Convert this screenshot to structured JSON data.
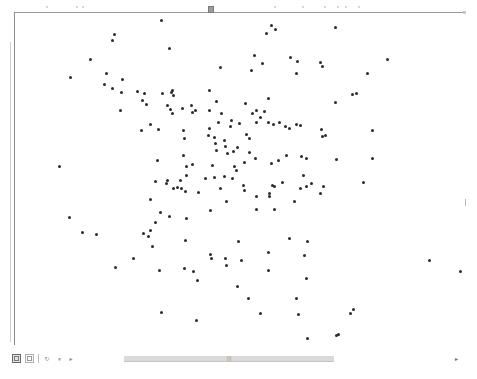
{
  "viewer": {
    "handle_icon": "resize-handle-icon",
    "toolbar": [
      {
        "name": "view-toggle-button",
        "icon": "grid-view-icon",
        "active": true
      },
      {
        "name": "page-button",
        "icon": "page-icon",
        "active": false
      },
      {
        "name": "refresh-button",
        "icon": "refresh-icon",
        "glyph": "↻"
      },
      {
        "name": "pause-button",
        "icon": "pause-icon",
        "glyph": "⏸"
      },
      {
        "name": "play-button",
        "icon": "play-icon",
        "glyph": "▸"
      }
    ],
    "scrollbar": {
      "thumb_grip": "|||",
      "right_arrow": "▸"
    }
  },
  "points": [
    [
      161,
      20
    ],
    [
      271,
      25
    ],
    [
      275,
      29
    ],
    [
      266,
      33
    ],
    [
      335,
      27
    ],
    [
      114,
      34
    ],
    [
      112,
      40
    ],
    [
      169,
      48
    ],
    [
      254,
      55
    ],
    [
      290,
      57
    ],
    [
      262,
      63
    ],
    [
      90,
      59
    ],
    [
      70,
      77
    ],
    [
      106,
      73
    ],
    [
      122,
      79
    ],
    [
      104,
      84
    ],
    [
      112,
      88
    ],
    [
      121,
      92
    ],
    [
      162,
      93
    ],
    [
      172,
      90
    ],
    [
      209,
      90
    ],
    [
      251,
      70
    ],
    [
      220,
      67
    ],
    [
      297,
      61
    ],
    [
      320,
      62
    ],
    [
      322,
      66
    ],
    [
      296,
      73
    ],
    [
      268,
      98
    ],
    [
      367,
      73
    ],
    [
      387,
      59
    ],
    [
      356,
      93
    ],
    [
      352,
      94
    ],
    [
      335,
      102
    ],
    [
      137,
      91
    ],
    [
      144,
      93
    ],
    [
      142,
      100
    ],
    [
      146,
      104
    ],
    [
      120,
      110
    ],
    [
      171,
      92
    ],
    [
      173,
      95
    ],
    [
      167,
      105
    ],
    [
      182,
      108
    ],
    [
      191,
      105
    ],
    [
      195,
      110
    ],
    [
      192,
      112
    ],
    [
      170,
      109
    ],
    [
      172,
      113
    ],
    [
      209,
      110
    ],
    [
      216,
      101
    ],
    [
      221,
      113
    ],
    [
      245,
      103
    ],
    [
      252,
      113
    ],
    [
      260,
      117
    ],
    [
      264,
      111
    ],
    [
      256,
      110
    ],
    [
      256,
      122
    ],
    [
      150,
      124
    ],
    [
      158,
      129
    ],
    [
      141,
      130
    ],
    [
      183,
      130
    ],
    [
      209,
      128
    ],
    [
      218,
      122
    ],
    [
      239,
      123
    ],
    [
      230,
      126
    ],
    [
      268,
      122
    ],
    [
      273,
      124
    ],
    [
      279,
      122
    ],
    [
      296,
      124
    ],
    [
      289,
      128
    ],
    [
      285,
      126
    ],
    [
      300,
      125
    ],
    [
      321,
      129
    ],
    [
      322,
      136
    ],
    [
      325,
      135
    ],
    [
      372,
      130
    ],
    [
      184,
      138
    ],
    [
      208,
      135
    ],
    [
      214,
      137
    ],
    [
      215,
      143
    ],
    [
      225,
      146
    ],
    [
      216,
      150
    ],
    [
      227,
      153
    ],
    [
      233,
      151
    ],
    [
      237,
      147
    ],
    [
      246,
      134
    ],
    [
      231,
      120
    ],
    [
      224,
      140
    ],
    [
      249,
      138
    ],
    [
      249,
      152
    ],
    [
      183,
      155
    ],
    [
      157,
      160
    ],
    [
      186,
      166
    ],
    [
      192,
      164
    ],
    [
      186,
      175
    ],
    [
      212,
      165
    ],
    [
      234,
      166
    ],
    [
      244,
      162
    ],
    [
      255,
      158
    ],
    [
      271,
      163
    ],
    [
      278,
      160
    ],
    [
      286,
      155
    ],
    [
      301,
      156
    ],
    [
      306,
      158
    ],
    [
      336,
      159
    ],
    [
      372,
      158
    ],
    [
      59,
      166
    ],
    [
      155,
      181
    ],
    [
      167,
      180
    ],
    [
      166,
      183
    ],
    [
      173,
      188
    ],
    [
      177,
      187
    ],
    [
      181,
      188
    ],
    [
      180,
      180
    ],
    [
      185,
      191
    ],
    [
      198,
      192
    ],
    [
      205,
      178
    ],
    [
      214,
      177
    ],
    [
      224,
      176
    ],
    [
      220,
      188
    ],
    [
      232,
      178
    ],
    [
      236,
      170
    ],
    [
      243,
      185
    ],
    [
      244,
      190
    ],
    [
      272,
      185
    ],
    [
      274,
      186
    ],
    [
      269,
      193
    ],
    [
      282,
      182
    ],
    [
      303,
      175
    ],
    [
      300,
      188
    ],
    [
      306,
      186
    ],
    [
      311,
      183
    ],
    [
      323,
      186
    ],
    [
      320,
      193
    ],
    [
      363,
      182
    ],
    [
      150,
      199
    ],
    [
      160,
      212
    ],
    [
      169,
      216
    ],
    [
      155,
      222
    ],
    [
      143,
      233
    ],
    [
      150,
      230
    ],
    [
      186,
      218
    ],
    [
      210,
      210
    ],
    [
      226,
      201
    ],
    [
      256,
      196
    ],
    [
      269,
      196
    ],
    [
      256,
      209
    ],
    [
      274,
      209
    ],
    [
      294,
      201
    ],
    [
      69,
      217
    ],
    [
      82,
      232
    ],
    [
      96,
      234
    ],
    [
      115,
      267
    ],
    [
      133,
      258
    ],
    [
      148,
      236
    ],
    [
      152,
      246
    ],
    [
      185,
      240
    ],
    [
      159,
      270
    ],
    [
      184,
      268
    ],
    [
      193,
      271
    ],
    [
      197,
      280
    ],
    [
      210,
      254
    ],
    [
      211,
      258
    ],
    [
      225,
      258
    ],
    [
      226,
      265
    ],
    [
      238,
      241
    ],
    [
      241,
      260
    ],
    [
      248,
      298
    ],
    [
      268,
      252
    ],
    [
      268,
      270
    ],
    [
      289,
      238
    ],
    [
      296,
      298
    ],
    [
      307,
      241
    ],
    [
      304,
      255
    ],
    [
      306,
      278
    ],
    [
      237,
      286
    ],
    [
      260,
      313
    ],
    [
      298,
      314
    ],
    [
      350,
      313
    ],
    [
      429,
      260
    ],
    [
      460,
      271
    ],
    [
      161,
      312
    ],
    [
      196,
      320
    ],
    [
      307,
      338
    ],
    [
      336,
      335
    ],
    [
      338,
      334
    ],
    [
      353,
      309
    ]
  ]
}
